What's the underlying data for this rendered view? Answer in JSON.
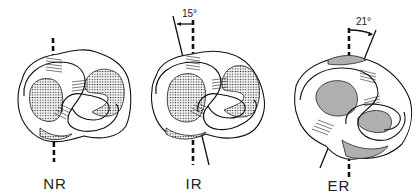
{
  "figure": {
    "panels": [
      {
        "id": "nr",
        "caption": "NR",
        "angle_label": null,
        "rotation_deg": 0
      },
      {
        "id": "ir",
        "caption": "IR",
        "angle_label": "15°",
        "rotation_deg": 15
      },
      {
        "id": "er",
        "caption": "ER",
        "angle_label": "21°",
        "rotation_deg": 21
      }
    ]
  }
}
